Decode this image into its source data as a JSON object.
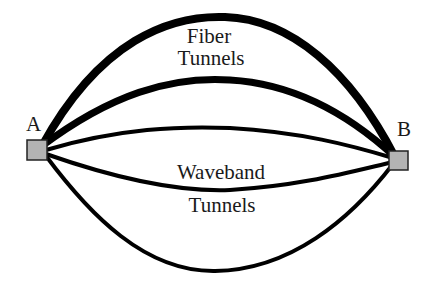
{
  "diagram": {
    "nodes": [
      {
        "id": "A",
        "label": "A",
        "fill": "#b3b3b3"
      },
      {
        "id": "B",
        "label": "B",
        "fill": "#b3b3b3"
      }
    ],
    "groups": {
      "fiber": {
        "label_line1": "Fiber",
        "label_line2": "Tunnels",
        "count": 2,
        "stroke": "thick"
      },
      "waveband": {
        "label_line1": "Waveband",
        "label_line2": "Tunnels",
        "count": 3,
        "stroke": "medium"
      }
    },
    "edges": [
      {
        "from": "A",
        "to": "B",
        "group": "fiber",
        "position": "outer-top"
      },
      {
        "from": "A",
        "to": "B",
        "group": "fiber",
        "position": "inner-top"
      },
      {
        "from": "A",
        "to": "B",
        "group": "waveband",
        "position": "upper"
      },
      {
        "from": "A",
        "to": "B",
        "group": "waveband",
        "position": "middle"
      },
      {
        "from": "A",
        "to": "B",
        "group": "waveband",
        "position": "bottom"
      }
    ]
  }
}
